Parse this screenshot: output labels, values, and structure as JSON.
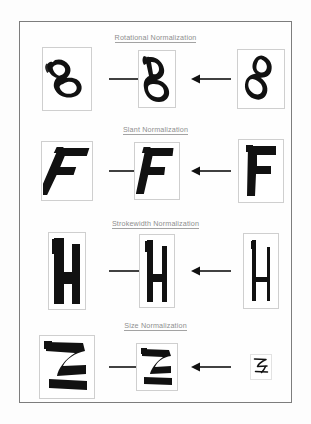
{
  "figure": {
    "border_color": "#7d7d7d",
    "background_color": "#fefefe",
    "ink_color": "#111111",
    "title_color": "#8e8e8e",
    "glyph_box_color": "#cfcfcf"
  },
  "sections": [
    {
      "id": "rotational",
      "title": "Rotational Normalization",
      "character": "B",
      "left": {
        "label": "B",
        "variation": "rotated-clockwise",
        "rotation_deg": -22,
        "scale": 1.0,
        "stroke": "normal"
      },
      "center": {
        "label": "B",
        "variation": "normalized",
        "rotation_deg": 0,
        "scale": 1.0,
        "stroke": "normal"
      },
      "right": {
        "label": "B",
        "variation": "rotated-counterclockwise",
        "rotation_deg": 24,
        "scale": 1.0,
        "stroke": "normal"
      },
      "left_arrow": "arrow-right",
      "right_arrow": "arrow-left"
    },
    {
      "id": "slant",
      "title": "Slant Normalization",
      "character": "F",
      "left": {
        "label": "F",
        "variation": "slanted-left",
        "skew_deg": 20,
        "scale": 1.0,
        "stroke": "normal"
      },
      "center": {
        "label": "F",
        "variation": "normalized",
        "skew_deg": 8,
        "scale": 1.0,
        "stroke": "normal"
      },
      "right": {
        "label": "F",
        "variation": "upright",
        "skew_deg": 0,
        "scale": 1.0,
        "stroke": "normal"
      },
      "left_arrow": "arrow-right",
      "right_arrow": "arrow-left"
    },
    {
      "id": "strokewidth",
      "title": "Strokewidth Normalization",
      "character": "H",
      "left": {
        "label": "H",
        "variation": "thick-stroke",
        "stroke_width": 11,
        "scale": 1.0
      },
      "center": {
        "label": "H",
        "variation": "normalized",
        "stroke_width": 6,
        "scale": 1.0
      },
      "right": {
        "label": "H",
        "variation": "thin-stroke",
        "stroke_width": 4,
        "scale": 1.0
      },
      "left_arrow": "arrow-right",
      "right_arrow": "arrow-left"
    },
    {
      "id": "size",
      "title": "Size Normalization",
      "character": "Z",
      "left": {
        "label": "Z",
        "variation": "oversized",
        "scale": 1.0,
        "stroke": "thick"
      },
      "center": {
        "label": "Z",
        "variation": "normalized",
        "scale": 0.72,
        "stroke": "normal"
      },
      "right": {
        "label": "Z",
        "variation": "undersized",
        "scale": 0.34,
        "stroke": "thin"
      },
      "left_arrow": "arrow-right",
      "right_arrow": "arrow-left"
    }
  ]
}
